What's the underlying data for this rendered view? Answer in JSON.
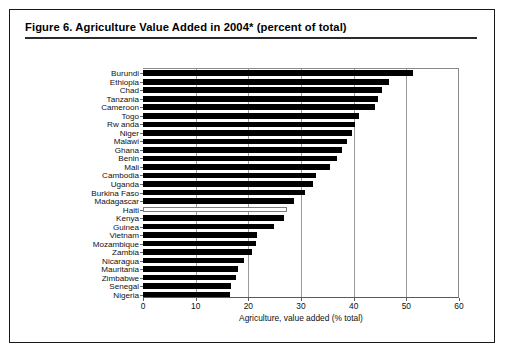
{
  "figure": {
    "title": "Figure 6.  Agriculture Value Added in 2004* (percent of total)"
  },
  "chart_data": {
    "type": "bar",
    "orientation": "horizontal",
    "title": "Figure 6.  Agriculture Value Added in 2004* (percent of total)",
    "xlabel": "Agriculture, value added (% total)",
    "ylabel": "",
    "xlim": [
      0,
      60
    ],
    "xticks": [
      0,
      10,
      20,
      30,
      40,
      50,
      60
    ],
    "xtick_labels": [
      "0",
      "10",
      "20",
      "30",
      "40",
      "50",
      "60"
    ],
    "grid": true,
    "grid_axis": "x",
    "legend": false,
    "bar_color": "#000000",
    "highlight_color": "#ffffff",
    "highlight_border": "#7d7d7d",
    "highlight_category": "Haiti",
    "categories": [
      "Burundi",
      "Ethiopia",
      "Chad",
      "Tanzania",
      "Cameroon",
      "Togo",
      "Rw anda",
      "Niger",
      "Malawi",
      "Ghana",
      "Benin",
      "Mali",
      "Cambodia",
      "Uganda",
      "Burkina Faso",
      "Madagascar",
      "Haiti",
      "Kenya",
      "Guinea",
      "Vietnam",
      "Mozambique",
      "Zambia",
      "Nicaragua",
      "Mauritania",
      "Zimbabwe",
      "Senegal",
      "Nigeria"
    ],
    "values": [
      51.3,
      46.8,
      45.4,
      44.6,
      44.0,
      41.0,
      40.2,
      39.6,
      38.7,
      37.8,
      36.9,
      35.5,
      32.9,
      32.2,
      30.8,
      28.6,
      27.4,
      26.8,
      24.8,
      21.6,
      21.5,
      20.7,
      19.1,
      18.1,
      17.6,
      16.8,
      16.5
    ]
  }
}
